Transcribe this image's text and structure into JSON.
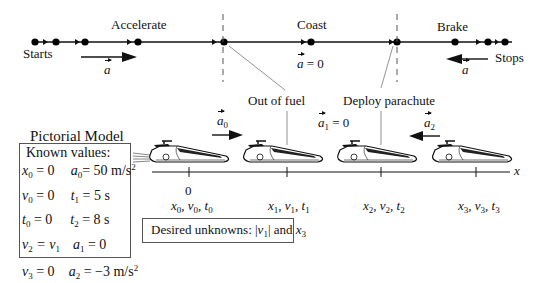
{
  "motion_diagram": {
    "phases": [
      {
        "label": "Accelerate",
        "accel_label": "a",
        "accel_direction": "right"
      },
      {
        "label": "Coast",
        "accel_label": "a = 0"
      },
      {
        "label": "Brake",
        "accel_label": "a",
        "accel_direction": "left"
      }
    ],
    "start_label": "Starts",
    "stop_label": "Stops",
    "events": [
      "Out of fuel",
      "Deploy parachute"
    ]
  },
  "pictorial_model": {
    "title": "Pictorial Model",
    "axis_label": "x",
    "origin_tick": "0",
    "accel_labels": {
      "a0": "a",
      "a0_sub": "0",
      "a1": "a",
      "a1_sub": "1",
      "a1_value": " = 0",
      "a2": "a",
      "a2_sub": "2"
    },
    "points": [
      {
        "x": "x",
        "v": "v",
        "t": "t",
        "sub": "0"
      },
      {
        "x": "x",
        "v": "v",
        "t": "t",
        "sub": "1"
      },
      {
        "x": "x",
        "v": "v",
        "t": "t",
        "sub": "2"
      },
      {
        "x": "x",
        "v": "v",
        "t": "t",
        "sub": "3"
      }
    ],
    "known_values": {
      "title": "Known values:",
      "rows": [
        {
          "l_var": "x",
          "l_sub": "0",
          "l_val": " = 0",
          "r_var": "a",
          "r_sub": "0",
          "r_val": "= 50 m/s",
          "r_sup": "2"
        },
        {
          "l_var": "v",
          "l_sub": "0",
          "l_val": " = 0",
          "r_var": "t",
          "r_sub": "1",
          "r_val": " = 5 s",
          "r_sup": ""
        },
        {
          "l_var": "t",
          "l_sub": "0",
          "l_val": " = 0",
          "r_var": "t",
          "r_sub": "2",
          "r_val": " = 8 s",
          "r_sup": ""
        },
        {
          "l_var": "v",
          "l_sub": "2",
          "l_val": " = v",
          "l_val_sub": "1",
          "r_var": "a",
          "r_sub": "1",
          "r_val": " = 0",
          "r_sup": ""
        },
        {
          "l_var": "v",
          "l_sub": "3",
          "l_val": " = 0",
          "r_var": "a",
          "r_sub": "2",
          "r_val": " = −3 m/s",
          "r_sup": "2"
        }
      ]
    },
    "desired_unknowns": {
      "prefix": "Desired unknowns: |",
      "v": "v",
      "v_sub": "1",
      "mid": "| and ",
      "x": "x",
      "x_sub": "3"
    }
  }
}
